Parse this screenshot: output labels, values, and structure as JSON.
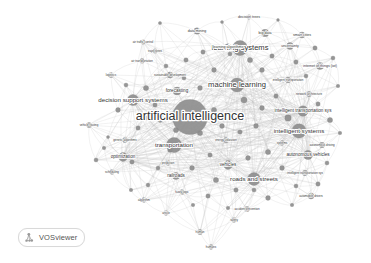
{
  "app": {
    "name": "VOSviewer",
    "badge_label": "VOSviewer",
    "logo_icon": "vosviewer-network-icon",
    "background_color": "#ffffff"
  },
  "canvas": {
    "width": 371,
    "height": 263
  },
  "style": {
    "node_color": "#8f8f8f",
    "node_stroke": "#7a7a7a",
    "edge_color": "#b9b9b9",
    "label_color": "#333333",
    "label_halo": "#ffffff"
  },
  "chart_data": {
    "type": "scatter",
    "title": "",
    "subtitle": "",
    "xlabel": "",
    "ylabel": "",
    "grid": false,
    "legend": "none",
    "render": "bibliometric term co-occurrence network (VOSviewer network visualization, grayscale)",
    "xlim": [
      0,
      371
    ],
    "ylim": [
      0,
      263
    ],
    "nodes": [
      {
        "label": "artificial intelligence",
        "x": 190,
        "y": 117,
        "r": 17.5,
        "weight": 100,
        "size_class": "huge"
      },
      {
        "label": "learning systems",
        "x": 240,
        "y": 48,
        "r": 7.5,
        "weight": 62,
        "size_class": "xlarge"
      },
      {
        "label": "machine learning",
        "x": 237,
        "y": 85,
        "r": 7.0,
        "weight": 60,
        "size_class": "xlarge"
      },
      {
        "label": "decision support systems",
        "x": 133,
        "y": 100,
        "r": 5.6,
        "weight": 48,
        "size_class": "large"
      },
      {
        "label": "transportation",
        "x": 174,
        "y": 145,
        "r": 7.6,
        "weight": 58,
        "size_class": "large"
      },
      {
        "label": "intelligent systems",
        "x": 299,
        "y": 131,
        "r": 7.2,
        "weight": 55,
        "size_class": "large"
      },
      {
        "label": "roads and streets",
        "x": 254,
        "y": 179,
        "r": 6.4,
        "weight": 50,
        "size_class": "large"
      },
      {
        "label": "intelligent transportation sys",
        "x": 303,
        "y": 111,
        "r": 5.2,
        "weight": 42,
        "size_class": "medium"
      },
      {
        "label": "autonomous vehicles",
        "x": 308,
        "y": 155,
        "r": 4.6,
        "weight": 38,
        "size_class": "medium"
      },
      {
        "label": "optimization",
        "x": 123,
        "y": 157,
        "r": 4.4,
        "weight": 36,
        "size_class": "medium"
      },
      {
        "label": "vehicles",
        "x": 228,
        "y": 165,
        "r": 4.4,
        "weight": 36,
        "size_class": "medium"
      },
      {
        "label": "forecasting",
        "x": 177,
        "y": 91,
        "r": 4.0,
        "weight": 33,
        "size_class": "medium"
      },
      {
        "label": "railroads",
        "x": 176,
        "y": 176,
        "r": 3.6,
        "weight": 30,
        "size_class": "medium"
      },
      {
        "label": "big data",
        "x": 265,
        "y": 33,
        "r": 3.8,
        "weight": 31,
        "size_class": "small"
      },
      {
        "label": "learning algorithms",
        "x": 228,
        "y": 47,
        "r": 3.2,
        "weight": 28,
        "size_class": "small"
      },
      {
        "label": "data mining",
        "x": 197,
        "y": 31,
        "r": 3.2,
        "weight": 28,
        "size_class": "small"
      },
      {
        "label": "decision trees",
        "x": 249,
        "y": 17,
        "r": 2.2,
        "weight": 18,
        "size_class": "small"
      },
      {
        "label": "smart cities",
        "x": 302,
        "y": 35,
        "r": 3.0,
        "weight": 26,
        "size_class": "small"
      },
      {
        "label": "uncertainty",
        "x": 290,
        "y": 46,
        "r": 3.4,
        "weight": 29,
        "size_class": "small"
      },
      {
        "label": "internet of things (iot)",
        "x": 320,
        "y": 66,
        "r": 3.6,
        "weight": 30,
        "size_class": "small"
      },
      {
        "label": "intelligent transportation",
        "x": 288,
        "y": 80,
        "r": 2.8,
        "weight": 24,
        "size_class": "tiny"
      },
      {
        "label": "network architecture",
        "x": 309,
        "y": 94,
        "r": 2.6,
        "weight": 22,
        "size_class": "tiny"
      },
      {
        "label": "autonomous driving",
        "x": 322,
        "y": 145,
        "r": 2.8,
        "weight": 24,
        "size_class": "tiny"
      },
      {
        "label": "intelligent transportation sys",
        "x": 305,
        "y": 173,
        "r": 2.8,
        "weight": 24,
        "size_class": "tiny"
      },
      {
        "label": "automobile drivers",
        "x": 311,
        "y": 196,
        "r": 3.0,
        "weight": 25,
        "size_class": "tiny"
      },
      {
        "label": "sustainable development",
        "x": 170,
        "y": 75,
        "r": 3.0,
        "weight": 26,
        "size_class": "tiny"
      },
      {
        "label": "air transportation",
        "x": 142,
        "y": 61,
        "r": 2.4,
        "weight": 20,
        "size_class": "tiny"
      },
      {
        "label": "trajectories",
        "x": 155,
        "y": 51,
        "r": 2.2,
        "weight": 18,
        "size_class": "tiny"
      },
      {
        "label": "air traffic control",
        "x": 143,
        "y": 42,
        "r": 2.2,
        "weight": 18,
        "size_class": "tiny"
      },
      {
        "label": "logistics",
        "x": 111,
        "y": 75,
        "r": 2.6,
        "weight": 22,
        "size_class": "tiny"
      },
      {
        "label": "vehicle routing",
        "x": 89,
        "y": 125,
        "r": 2.6,
        "weight": 22,
        "size_class": "tiny"
      },
      {
        "label": "genetic algorithms",
        "x": 125,
        "y": 140,
        "r": 2.6,
        "weight": 22,
        "size_class": "tiny"
      },
      {
        "label": "scheduling",
        "x": 112,
        "y": 172,
        "r": 2.4,
        "weight": 20,
        "size_class": "tiny"
      },
      {
        "label": "prediction",
        "x": 168,
        "y": 163,
        "r": 2.4,
        "weight": 20,
        "size_class": "tiny"
      },
      {
        "label": "energy utilization",
        "x": 226,
        "y": 140,
        "r": 2.6,
        "weight": 22,
        "size_class": "tiny"
      },
      {
        "label": "systems",
        "x": 282,
        "y": 143,
        "r": 2.4,
        "weight": 20,
        "size_class": "tiny"
      },
      {
        "label": "fuzzy logic",
        "x": 182,
        "y": 192,
        "r": 2.4,
        "weight": 20,
        "size_class": "tiny"
      },
      {
        "label": "algorithm",
        "x": 144,
        "y": 200,
        "r": 2.4,
        "weight": 20,
        "size_class": "tiny"
      },
      {
        "label": "article",
        "x": 166,
        "y": 213,
        "r": 2.4,
        "weight": 20,
        "size_class": "tiny"
      },
      {
        "label": "accident prevention",
        "x": 247,
        "y": 209,
        "r": 2.6,
        "weight": 22,
        "size_class": "tiny"
      },
      {
        "label": "safety",
        "x": 234,
        "y": 220,
        "r": 2.4,
        "weight": 20,
        "size_class": "tiny"
      },
      {
        "label": "human",
        "x": 200,
        "y": 232,
        "r": 2.6,
        "weight": 22,
        "size_class": "tiny"
      },
      {
        "label": "humans",
        "x": 211,
        "y": 247,
        "r": 2.4,
        "weight": 20,
        "size_class": "tiny"
      }
    ],
    "extra_nodes": [
      {
        "x": 160,
        "y": 23,
        "r": 1.6
      },
      {
        "x": 222,
        "y": 22,
        "r": 1.5
      },
      {
        "x": 278,
        "y": 20,
        "r": 1.4
      },
      {
        "x": 315,
        "y": 48,
        "r": 2.2
      },
      {
        "x": 333,
        "y": 58,
        "r": 2.0
      },
      {
        "x": 338,
        "y": 86,
        "r": 1.8
      },
      {
        "x": 330,
        "y": 120,
        "r": 2.6
      },
      {
        "x": 340,
        "y": 133,
        "r": 1.8
      },
      {
        "x": 327,
        "y": 163,
        "r": 2.0
      },
      {
        "x": 318,
        "y": 184,
        "r": 2.2
      },
      {
        "x": 292,
        "y": 205,
        "r": 1.8
      },
      {
        "x": 268,
        "y": 198,
        "r": 2.4
      },
      {
        "x": 208,
        "y": 196,
        "r": 2.2
      },
      {
        "x": 193,
        "y": 205,
        "r": 1.8
      },
      {
        "x": 148,
        "y": 185,
        "r": 1.9
      },
      {
        "x": 131,
        "y": 190,
        "r": 1.8
      },
      {
        "x": 104,
        "y": 148,
        "r": 1.8
      },
      {
        "x": 96,
        "y": 160,
        "r": 2.0
      },
      {
        "x": 108,
        "y": 137,
        "r": 1.5
      },
      {
        "x": 118,
        "y": 110,
        "r": 2.4
      },
      {
        "x": 126,
        "y": 85,
        "r": 2.0
      },
      {
        "x": 146,
        "y": 88,
        "r": 2.6
      },
      {
        "x": 155,
        "y": 105,
        "r": 2.2
      },
      {
        "x": 166,
        "y": 66,
        "r": 2.0
      },
      {
        "x": 186,
        "y": 60,
        "r": 2.2
      },
      {
        "x": 203,
        "y": 52,
        "r": 2.2
      },
      {
        "x": 214,
        "y": 70,
        "r": 2.4
      },
      {
        "x": 250,
        "y": 60,
        "r": 2.6
      },
      {
        "x": 262,
        "y": 70,
        "r": 2.4
      },
      {
        "x": 272,
        "y": 56,
        "r": 2.2
      },
      {
        "x": 244,
        "y": 100,
        "r": 3.0
      },
      {
        "x": 262,
        "y": 108,
        "r": 2.4
      },
      {
        "x": 276,
        "y": 96,
        "r": 2.2
      },
      {
        "x": 288,
        "y": 118,
        "r": 3.2
      },
      {
        "x": 214,
        "y": 110,
        "r": 2.6
      },
      {
        "x": 222,
        "y": 126,
        "r": 2.4
      },
      {
        "x": 200,
        "y": 133,
        "r": 2.6
      },
      {
        "x": 240,
        "y": 132,
        "r": 2.2
      },
      {
        "x": 256,
        "y": 126,
        "r": 2.4
      },
      {
        "x": 268,
        "y": 152,
        "r": 2.6
      },
      {
        "x": 248,
        "y": 158,
        "r": 2.4
      },
      {
        "x": 210,
        "y": 155,
        "r": 2.2
      },
      {
        "x": 192,
        "y": 168,
        "r": 2.4
      },
      {
        "x": 216,
        "y": 180,
        "r": 2.6
      },
      {
        "x": 236,
        "y": 190,
        "r": 2.2
      },
      {
        "x": 282,
        "y": 168,
        "r": 2.4
      },
      {
        "x": 296,
        "y": 186,
        "r": 2.0
      },
      {
        "x": 176,
        "y": 130,
        "r": 2.6
      },
      {
        "x": 160,
        "y": 120,
        "r": 2.4
      },
      {
        "x": 146,
        "y": 118,
        "r": 2.0
      },
      {
        "x": 138,
        "y": 128,
        "r": 2.2
      },
      {
        "x": 230,
        "y": 54,
        "r": 2.0
      },
      {
        "x": 296,
        "y": 62,
        "r": 2.2
      },
      {
        "x": 306,
        "y": 76,
        "r": 2.0
      },
      {
        "x": 318,
        "y": 104,
        "r": 2.2
      },
      {
        "x": 200,
        "y": 88,
        "r": 2.4
      },
      {
        "x": 184,
        "y": 78,
        "r": 2.0
      },
      {
        "x": 170,
        "y": 150,
        "r": 2.4
      },
      {
        "x": 158,
        "y": 168,
        "r": 2.0
      },
      {
        "x": 228,
        "y": 208,
        "r": 1.8
      },
      {
        "x": 254,
        "y": 190,
        "r": 2.0
      },
      {
        "x": 132,
        "y": 162,
        "r": 2.2
      }
    ]
  }
}
